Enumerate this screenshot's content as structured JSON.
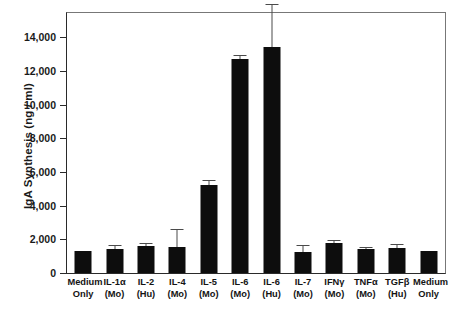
{
  "chart_data": {
    "type": "bar",
    "title": "",
    "xlabel": "",
    "ylabel": "IgA Synthesis (ng / ml)",
    "ylim": [
      0,
      15500
    ],
    "yticks": [
      0,
      2000,
      4000,
      6000,
      8000,
      10000,
      12000,
      14000
    ],
    "ytick_labels": [
      "0",
      "2,000",
      "4,000",
      "6,000",
      "8,000",
      "10,000",
      "12,000",
      "14,000"
    ],
    "grid": false,
    "legend": "none",
    "categories": [
      "Medium Only",
      "IL-1α (Mo)",
      "IL-2 (Hu)",
      "IL-4 (Mo)",
      "IL-5 (Mo)",
      "IL-6 (Mo)",
      "IL-6 (Hu)",
      "IL-7 (Mo)",
      "IFNγ (Mo)",
      "TNFα (Mo)",
      "TGFβ (Hu)",
      "Medium Only"
    ],
    "category_lines": [
      {
        "line1": "Medium",
        "line2": "Only"
      },
      {
        "line1": "IL-1α",
        "line2": "(Mo)"
      },
      {
        "line1": "IL-2",
        "line2": "(Hu)"
      },
      {
        "line1": "IL-4",
        "line2": "(Mo)"
      },
      {
        "line1": "IL-5",
        "line2": "(Mo)"
      },
      {
        "line1": "IL-6",
        "line2": "(Mo)"
      },
      {
        "line1": "IL-6",
        "line2": "(Hu)"
      },
      {
        "line1": "IL-7",
        "line2": "(Mo)"
      },
      {
        "line1": "IFNγ",
        "line2": "(Mo)"
      },
      {
        "line1": "TNFα",
        "line2": "(Mo)"
      },
      {
        "line1": "TGFβ",
        "line2": "(Hu)"
      },
      {
        "line1": "Medium",
        "line2": "Only"
      }
    ],
    "values": [
      1300,
      1450,
      1600,
      1550,
      5200,
      12700,
      13400,
      1250,
      1800,
      1400,
      1500,
      1300
    ],
    "errors": [
      0,
      150,
      130,
      1000,
      250,
      200,
      2500,
      350,
      130,
      100,
      150,
      0
    ],
    "bar_color": "#0d0d0d",
    "error_color": "#4a4a4a",
    "axis_color": "#2a2a2a"
  }
}
